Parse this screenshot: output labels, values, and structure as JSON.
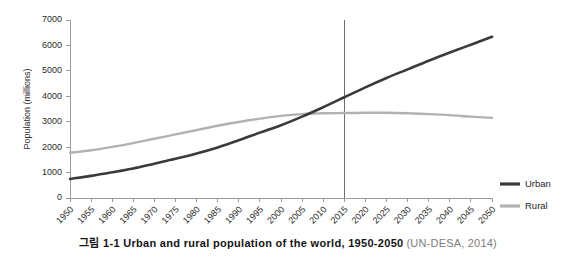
{
  "caption": {
    "main": "그림 1-1 Urban and rural population of the world, 1950-2050",
    "source": "(UN-DESA, 2014)"
  },
  "legend": {
    "position": "right",
    "items": [
      {
        "label": "Urban",
        "color": "#3a3a3a"
      },
      {
        "label": "Rural",
        "color": "#b2b2b2"
      }
    ]
  },
  "annotations": [
    {
      "name": "year-marker-2015",
      "type": "vline",
      "x": 2015,
      "color": "#6e6e6e"
    }
  ],
  "chart_data": {
    "type": "line",
    "title": "",
    "xlabel": "",
    "ylabel": "Population (millions)",
    "xlim": [
      1950,
      2050
    ],
    "ylim": [
      0,
      7000
    ],
    "grid": false,
    "legend_position": "right",
    "x": [
      1950,
      1955,
      1960,
      1965,
      1970,
      1975,
      1980,
      1985,
      1990,
      1995,
      2000,
      2005,
      2010,
      2015,
      2020,
      2025,
      2030,
      2035,
      2040,
      2045,
      2050
    ],
    "xticklabels": [
      "1950",
      "1955",
      "1960",
      "1965",
      "1970",
      "1975",
      "1980",
      "1985",
      "1990",
      "1995",
      "2000",
      "2005",
      "2010",
      "2015",
      "2020",
      "2025",
      "2030",
      "2035",
      "2040",
      "2045",
      "2050"
    ],
    "yticks": [
      0,
      1000,
      2000,
      3000,
      4000,
      5000,
      6000,
      7000
    ],
    "yticklabels": [
      "0",
      "1000",
      "2000",
      "3000",
      "4000",
      "5000",
      "6000",
      "7000"
    ],
    "series": [
      {
        "name": "Urban",
        "color": "#3a3a3a",
        "values": [
          750,
          870,
          1010,
          1160,
          1350,
          1540,
          1750,
          1990,
          2270,
          2570,
          2860,
          3200,
          3570,
          3960,
          4350,
          4720,
          5060,
          5400,
          5720,
          6030,
          6340
        ]
      },
      {
        "name": "Rural",
        "color": "#b2b2b2",
        "values": [
          1780,
          1880,
          2010,
          2160,
          2330,
          2500,
          2670,
          2840,
          2990,
          3120,
          3230,
          3300,
          3330,
          3340,
          3350,
          3350,
          3330,
          3300,
          3260,
          3200,
          3150
        ]
      }
    ]
  }
}
